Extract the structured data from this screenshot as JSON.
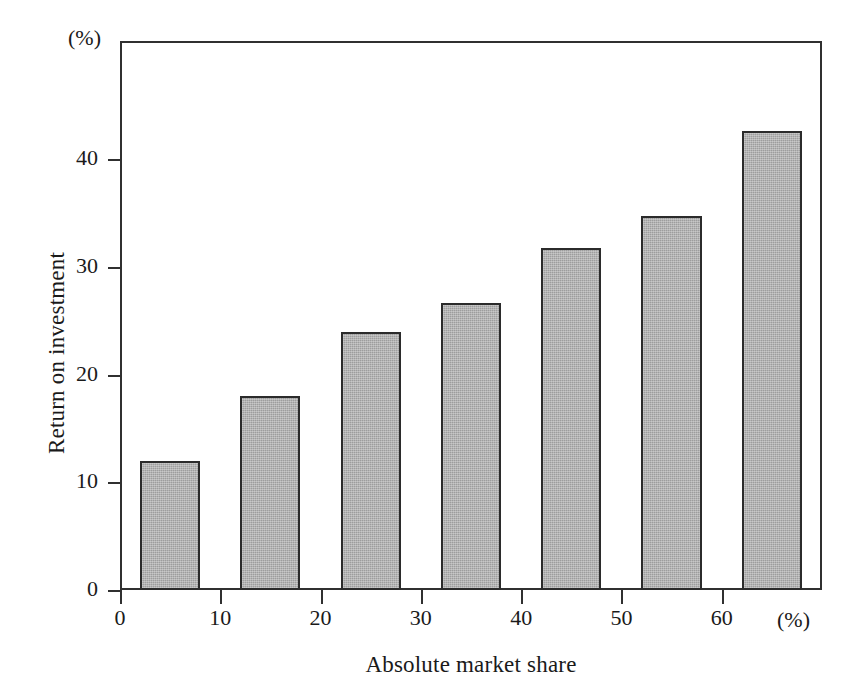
{
  "chart_data": {
    "type": "bar",
    "title": "",
    "xlabel": "Absolute market share",
    "ylabel": "Return on investment",
    "x_unit": "(%)",
    "y_unit": "(%)",
    "categories": [
      "5",
      "15",
      "25",
      "35",
      "45",
      "55",
      "65"
    ],
    "x": [
      5,
      15,
      25,
      35,
      45,
      55,
      65
    ],
    "values": [
      12.0,
      18.0,
      24.0,
      26.7,
      31.8,
      34.7,
      42.6
    ],
    "bar_width_units": 6,
    "xlim": [
      0,
      70
    ],
    "ylim": [
      0,
      51
    ],
    "xticks": [
      0,
      10,
      20,
      30,
      40,
      50,
      60
    ],
    "xtick_labels": [
      "0",
      "10",
      "20",
      "30",
      "40",
      "50",
      "60"
    ],
    "yticks": [
      0,
      10,
      20,
      30,
      40
    ],
    "ytick_labels": [
      "0",
      "10",
      "20",
      "30",
      "40"
    ],
    "grid": false,
    "legend": null,
    "bar_color": "#9d9d9d",
    "bar_edge_color": "#2b2b2b",
    "axis_color": "#303030",
    "background_color": "#ffffff"
  }
}
